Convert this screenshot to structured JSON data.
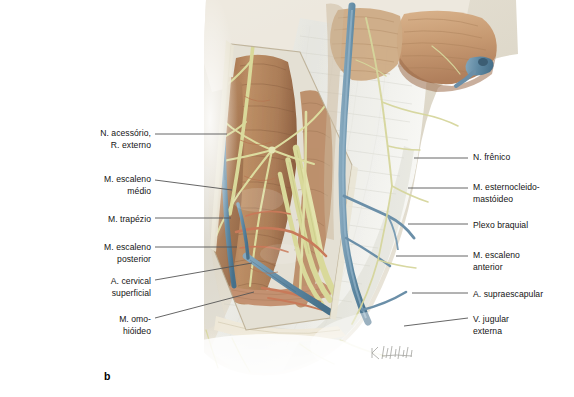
{
  "figure": {
    "panel_letter": "b",
    "artist_signature": "K. Wesker"
  },
  "labels_left": [
    {
      "id": "n-acessorio-r-externo",
      "name": "N. acessório,\nR. externo",
      "text_x": 151,
      "text_y": 128,
      "line": [
        155,
        134,
        227,
        134
      ]
    },
    {
      "id": "m-escaleno-medio",
      "name": "M. escaleno\nmédio",
      "text_x": 151,
      "text_y": 174,
      "line": [
        155,
        180,
        232,
        190
      ]
    },
    {
      "id": "m-trapezio",
      "name": "M. trapézio",
      "text_x": 151,
      "text_y": 214,
      "line": [
        155,
        218,
        231,
        218
      ]
    },
    {
      "id": "m-escaleno-posterior",
      "name": "M. escaleno\nposterior",
      "text_x": 151,
      "text_y": 242,
      "line": [
        155,
        247,
        237,
        247
      ]
    },
    {
      "id": "a-cervical-superficial",
      "name": "A. cervical\nsuperficial",
      "text_x": 151,
      "text_y": 276,
      "line": [
        155,
        280,
        252,
        263
      ]
    },
    {
      "id": "m-omo-hioideo",
      "name": "M. omo-\nhióideo",
      "text_x": 151,
      "text_y": 314,
      "line": [
        155,
        318,
        254,
        292
      ]
    }
  ],
  "labels_right": [
    {
      "id": "n-frenico",
      "name": "N. frênico",
      "text_x": 473,
      "text_y": 152,
      "line": [
        414,
        158,
        468,
        158
      ]
    },
    {
      "id": "m-esternocleidomastoideo",
      "name": "M. esternocleido-\nmastóideo",
      "text_x": 473,
      "text_y": 182,
      "line": [
        408,
        188,
        468,
        188
      ]
    },
    {
      "id": "plexo-braquial",
      "name": "Plexo braquial",
      "text_x": 473,
      "text_y": 220,
      "line": [
        408,
        224,
        468,
        224
      ]
    },
    {
      "id": "m-escaleno-anterior",
      "name": "M. escaleno\nanterior",
      "text_x": 473,
      "text_y": 250,
      "line": [
        396,
        256,
        468,
        256
      ]
    },
    {
      "id": "a-supraescapular",
      "name": "A. supraescapular",
      "text_x": 473,
      "text_y": 289,
      "line": [
        412,
        293,
        468,
        293
      ]
    },
    {
      "id": "v-jugular-externa",
      "name": "V. jugular\nexterna",
      "text_x": 473,
      "text_y": 314,
      "line": [
        404,
        326,
        468,
        318
      ]
    }
  ],
  "colors": {
    "leader_line": "#555555",
    "label_text": "#141414",
    "background": "#ffffff",
    "muscle": "#b08968",
    "muscle_light": "#c9a484",
    "muscle_dark": "#8e6a4c",
    "nerve": "#d9d99a",
    "nerve_pale": "#e6e6bd",
    "vein": "#6b8fa8",
    "vein_dark": "#4f7187",
    "artery": "#c87a5a",
    "fascia": "#e8e8e2",
    "fascia_shadow": "#d2d2c9",
    "skin": "#dfd9cc"
  }
}
